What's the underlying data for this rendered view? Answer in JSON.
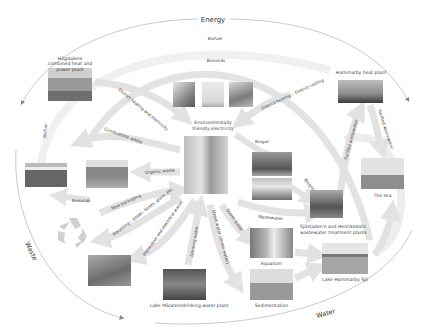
{
  "cycles": {
    "energy": "Energy",
    "waste": "Waste",
    "water": "Water"
  },
  "nodes": {
    "hogdalen": "Högdalens combined heat and power plant",
    "hammarby_heat": "Hammarby heat plant",
    "env_electricity_1": "Environmentally",
    "env_electricity_2": "friendly electricity",
    "the_sea": "The sea",
    "sjostaden_1": "Sjöstaden's and Henriksdal's",
    "sjostaden_2": "wastewater treatment plants",
    "equalizer": "Equalizer",
    "sedimentation": "Sedimentation",
    "lake_hammarby": "Lake Hammarby Sjö",
    "lake_malaren": "Lake Mälaren/drinking water plant"
  },
  "flows": {
    "biofuel_top": "Biofuel",
    "biosolids_top": "Biosolids",
    "district_heating_electricity": "District heating and electricity",
    "district_heating_cooling": "District heating – District cooling",
    "combustible_waste": "Combustible waste",
    "biofuel_left": "Biofuel",
    "biogas_1": "Biogas",
    "biogas_2": "Biogas",
    "purified_wastewater": "Purified wastewater",
    "purified_wastewater_2": "Purified wastewater",
    "organic_waste": "Organic waste",
    "biosolids_left": "Biosolids",
    "new_packaging": "New packaging",
    "recycling": "Recycling – paper, boxes, glass, etc.",
    "hazardous_waste": "Hazardous and electrical waste",
    "drinking_water": "Drinking water",
    "street_water": "Street water (storm water)",
    "storm_water": "Storm water",
    "wastewater": "Wastewater"
  },
  "colors": {
    "arrow": "#e4e4e4",
    "arc": "#c8c8c8",
    "text": "#333333"
  }
}
